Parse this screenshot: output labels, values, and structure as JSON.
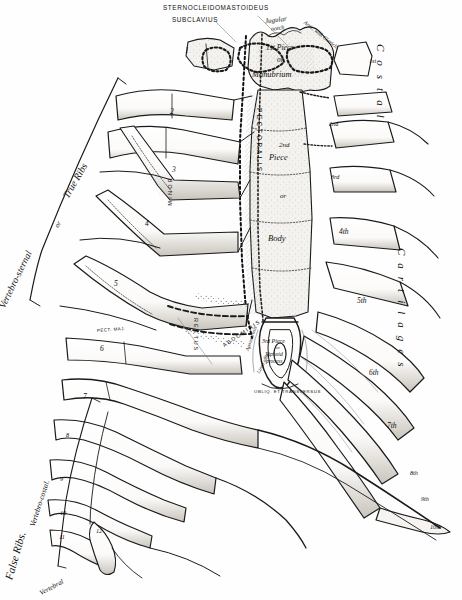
{
  "plate": {
    "title": "Sternum and Costal Cartilages, anterior view",
    "ink_color": "#1a1a1a",
    "paper_color": "#fefefe",
    "shade_color": "#8d8d8d"
  },
  "top_labels": {
    "sternocleidomastoideus": "STERNOCLEIDOMASTOIDEUS",
    "subclavius": "SUBCLAVIUS"
  },
  "sternum": {
    "jugular_notch": "Jugular",
    "jugular_notch2": "notch",
    "artic_clavicle": "Artic. with Clavicle",
    "first_piece_a": "1st Piece",
    "first_piece_or": "or",
    "manubrium": "Manubrium",
    "second_piece_a": "2nd",
    "second_piece_b": "Piece",
    "second_piece_or": "or",
    "body": "Body",
    "third_piece": "3rd Piece",
    "third_piece_or": "or",
    "xiphoid_a": "Xiphoid",
    "xiphoid_b": "process",
    "aponeurosis": "Aponeurosis",
    "linea_alba": "Linea alba",
    "obliq_transversus": "OBLIQ. ET TRANSVERSUS"
  },
  "muscles": {
    "pectoralis_major_vert": "PECTORALIS",
    "pectoralis_minor_vert": "MINOR",
    "pect_maj_small": "PECT. MAJ.",
    "rectus_vert": "RECTUS",
    "abdominis_vert": "ABDOMINIS"
  },
  "side_labels": {
    "vertebro_sternal": "Vertebro-sternal",
    "vertebro_sternal_or": "or",
    "true_ribs": "True Ribs",
    "false_ribs": "False   Ribs.",
    "vertebro_costal": "Vertebro-costal.",
    "vertebral": "Vertebral",
    "costal": "Costal",
    "cartilages": "Cartilages"
  },
  "rib_numbers_left": [
    "1",
    "2",
    "3",
    "4",
    "5",
    "6",
    "7",
    "8",
    "9",
    "10",
    "11",
    "12"
  ],
  "cartilage_numbers_right": [
    "1st",
    "2nd",
    "3rd",
    "4th",
    "5th",
    "6th",
    "7th",
    "8th",
    "9th",
    "10th"
  ]
}
